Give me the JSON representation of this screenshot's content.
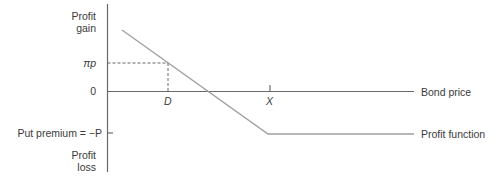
{
  "y_axis": {
    "top_label_line1": "Profit",
    "top_label_line2": "gain",
    "bottom_label_line1": "Profit",
    "bottom_label_line2": "loss",
    "tick_pip": "πp",
    "tick_zero": "0",
    "tick_put_premium": "Put premium = −P"
  },
  "x_axis": {
    "label": "Bond price",
    "tick_d": "D",
    "tick_x": "X"
  },
  "curve": {
    "label": "Profit function"
  },
  "colors": {
    "axis": "#6a6a6a",
    "curve": "#a0a0a0",
    "dashed": "#555555",
    "text": "#3a3a3a"
  }
}
